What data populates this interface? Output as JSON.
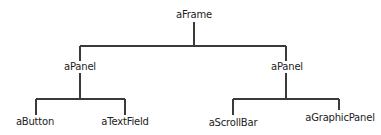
{
  "diagram": {
    "type": "tree",
    "colors": {
      "line": "#3a3a3a",
      "text": "#222222",
      "background": "#ffffff"
    },
    "root": {
      "label": "aFrame",
      "children": [
        {
          "label": "aPanel",
          "children": [
            {
              "label": "aButton"
            },
            {
              "label": "aTextField"
            }
          ]
        },
        {
          "label": "aPanel",
          "children": [
            {
              "label": "aScrollBar"
            },
            {
              "label": "aGraphicPanel"
            }
          ]
        }
      ]
    },
    "nodes": {
      "frame": "aFrame",
      "panel_left": "aPanel",
      "panel_right": "aPanel",
      "button": "aButton",
      "text_field": "aTextField",
      "scroll_bar": "aScrollBar",
      "graphic_panel": "aGraphicPanel"
    }
  }
}
